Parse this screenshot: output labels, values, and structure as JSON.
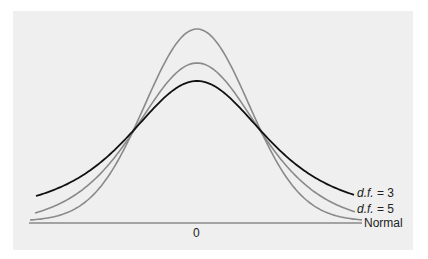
{
  "chart_data": {
    "type": "line",
    "title": "",
    "xlabel": "",
    "ylabel": "",
    "x_ticks": [
      0
    ],
    "x_tick_labels": [
      "0"
    ],
    "grid": false,
    "legend_position": "inline-right",
    "series": [
      {
        "name": "Normal",
        "label_prefix": "",
        "label_text": "Normal",
        "color": "#8a8a8a",
        "peak_y_px": 29,
        "end_y_px": 220,
        "sigma_px": 52,
        "kind": "normal"
      },
      {
        "name": "d.f. = 5",
        "label_prefix": "d.f.",
        "label_text": " = 5",
        "color": "#8a8a8a",
        "peak_y_px": 63,
        "end_y_px": 213,
        "sigma_px": 64,
        "kind": "t"
      },
      {
        "name": "d.f. = 3",
        "label_prefix": "d.f.",
        "label_text": " = 3",
        "color": "#111111",
        "peak_y_px": 81,
        "end_y_px": 196,
        "sigma_px": 72,
        "kind": "t"
      }
    ],
    "center_x_px": 197,
    "baseline_y_px": 223
  },
  "labels": {
    "df3_prefix": "d.f.",
    "df3_suffix": " = 3",
    "df5_prefix": "d.f.",
    "df5_suffix": " = 5",
    "normal": "Normal",
    "zero": "0"
  }
}
